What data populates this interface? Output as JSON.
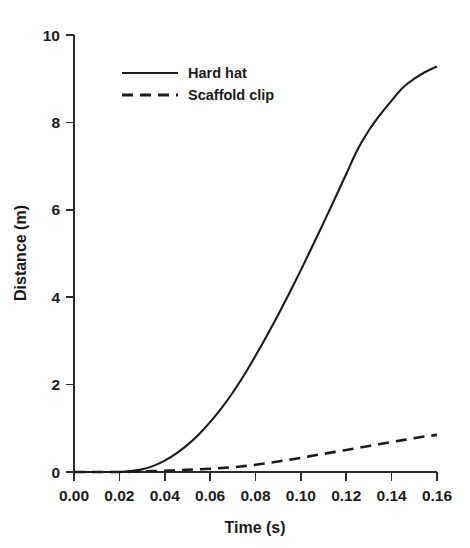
{
  "chart_data": {
    "type": "line",
    "title": "",
    "subtitle": "",
    "xlabel": "Time  (s)",
    "ylabel": "Distance  (m)",
    "xlim": [
      0.0,
      0.16
    ],
    "ylim": [
      0,
      10
    ],
    "grid": false,
    "legend_position": "upper-left",
    "xticks": [
      0.0,
      0.02,
      0.04,
      0.06,
      0.08,
      0.1,
      0.12,
      0.14,
      0.16
    ],
    "xtick_labels": [
      "0.00",
      "0.02",
      "0.04",
      "0.06",
      "0.08",
      "0.10",
      "0.12",
      "0.14",
      "0.16"
    ],
    "yticks": [
      0,
      2,
      4,
      6,
      8,
      10
    ],
    "ytick_labels": [
      "0",
      "2",
      "4",
      "6",
      "8",
      "10"
    ],
    "x": [
      0.0,
      0.005,
      0.01,
      0.015,
      0.02,
      0.025,
      0.03,
      0.035,
      0.04,
      0.045,
      0.05,
      0.055,
      0.06,
      0.065,
      0.07,
      0.075,
      0.08,
      0.085,
      0.09,
      0.095,
      0.1,
      0.105,
      0.11,
      0.115,
      0.12,
      0.125,
      0.13,
      0.135,
      0.14,
      0.145,
      0.15,
      0.155,
      0.16
    ],
    "series": [
      {
        "name": "Hard hat",
        "style": "solid",
        "color": "#1a1a1a",
        "values": [
          0.0,
          0.0,
          0.0,
          0.0,
          0.0,
          0.02,
          0.06,
          0.14,
          0.26,
          0.42,
          0.62,
          0.86,
          1.14,
          1.46,
          1.82,
          2.22,
          2.66,
          3.12,
          3.6,
          4.1,
          4.62,
          5.16,
          5.7,
          6.26,
          6.82,
          7.38,
          7.82,
          8.18,
          8.5,
          8.8,
          9.0,
          9.16,
          9.28
        ]
      },
      {
        "name": "Scaffold clip",
        "style": "dashed",
        "color": "#1a1a1a",
        "values": [
          0.0,
          0.0,
          0.0,
          0.0,
          0.0,
          0.005,
          0.012,
          0.02,
          0.03,
          0.04,
          0.05,
          0.062,
          0.075,
          0.09,
          0.11,
          0.135,
          0.165,
          0.2,
          0.24,
          0.282,
          0.325,
          0.37,
          0.415,
          0.46,
          0.505,
          0.55,
          0.595,
          0.64,
          0.685,
          0.73,
          0.775,
          0.815,
          0.85
        ]
      }
    ],
    "annotations": []
  },
  "legend": {
    "entries": [
      {
        "label": "Hard hat",
        "style": "solid"
      },
      {
        "label": "Scaffold clip",
        "style": "dashed"
      }
    ]
  },
  "axes": {
    "x_title": "Time  (s)",
    "y_title": "Distance  (m)"
  }
}
